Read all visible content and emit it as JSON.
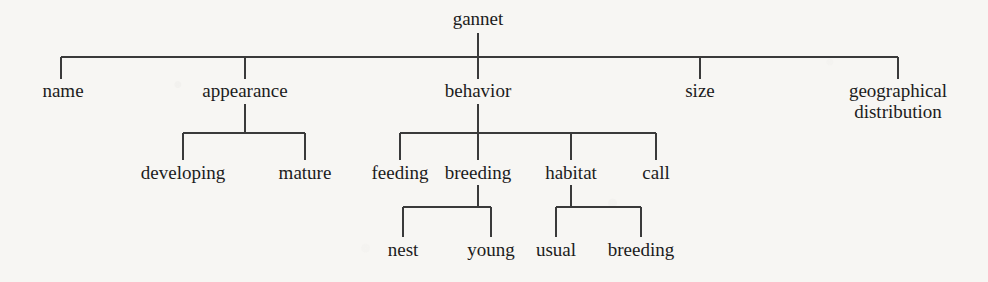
{
  "diagram": {
    "type": "tree",
    "title": "gannet",
    "line_color": "#3a3a3a",
    "text_color": "#1c1c1c",
    "background_color": "#f7f6f3",
    "root": {
      "label": "gannet",
      "x": 478,
      "y": 24
    },
    "level_one": [
      {
        "label": "name",
        "x": 63,
        "y": 96
      },
      {
        "label": "appearance",
        "x": 245,
        "y": 96
      },
      {
        "label": "behavior",
        "x": 478,
        "y": 96
      },
      {
        "label": "size",
        "x": 700,
        "y": 96
      },
      {
        "label": "geographical distribution",
        "x": 898,
        "y": 96,
        "wrap": true
      }
    ],
    "level_two": [
      {
        "label": "developing",
        "parent": "appearance",
        "x": 183,
        "y": 178
      },
      {
        "label": "mature",
        "parent": "appearance",
        "x": 305,
        "y": 178
      },
      {
        "label": "feeding",
        "parent": "behavior",
        "x": 400,
        "y": 178
      },
      {
        "label": "breeding",
        "parent": "behavior",
        "x": 478,
        "y": 178
      },
      {
        "label": "habitat",
        "parent": "behavior",
        "x": 571,
        "y": 178
      },
      {
        "label": "call",
        "parent": "behavior",
        "x": 656,
        "y": 178
      }
    ],
    "level_three": [
      {
        "label": "nest",
        "parent": "breeding",
        "x": 403,
        "y": 255
      },
      {
        "label": "young",
        "parent": "breeding",
        "x": 491,
        "y": 255
      },
      {
        "label": "usual",
        "parent": "habitat",
        "x": 556,
        "y": 255
      },
      {
        "label": "breeding",
        "parent": "habitat",
        "x": 641,
        "y": 255
      }
    ],
    "edges": {
      "root_stem": {
        "x": 478,
        "y1": 33,
        "y2": 57
      },
      "level_one_bar": {
        "y": 57,
        "x1": 61,
        "x2": 898
      },
      "level_one_drops": [
        {
          "x": 61,
          "y1": 57,
          "y2": 79
        },
        {
          "x": 245,
          "y1": 57,
          "y2": 79
        },
        {
          "x": 478,
          "y1": 57,
          "y2": 79
        },
        {
          "x": 700,
          "y1": 57,
          "y2": 79
        },
        {
          "x": 898,
          "y1": 57,
          "y2": 79
        }
      ],
      "appearance_stem": {
        "x": 245,
        "y1": 104,
        "y2": 133
      },
      "appearance_bar": {
        "y": 133,
        "x1": 183,
        "x2": 305
      },
      "appearance_drops": [
        {
          "x": 183,
          "y1": 133,
          "y2": 160
        },
        {
          "x": 305,
          "y1": 133,
          "y2": 160
        }
      ],
      "behavior_stem": {
        "x": 478,
        "y1": 104,
        "y2": 133
      },
      "behavior_bar": {
        "y": 133,
        "x1": 400,
        "x2": 656
      },
      "behavior_drops": [
        {
          "x": 400,
          "y1": 133,
          "y2": 160
        },
        {
          "x": 478,
          "y1": 133,
          "y2": 160
        },
        {
          "x": 571,
          "y1": 133,
          "y2": 160
        },
        {
          "x": 656,
          "y1": 133,
          "y2": 160
        }
      ],
      "breeding_stem": {
        "x": 478,
        "y1": 185,
        "y2": 207
      },
      "breeding_bar": {
        "y": 207,
        "x1": 403,
        "x2": 491
      },
      "breeding_drops": [
        {
          "x": 403,
          "y1": 207,
          "y2": 237
        },
        {
          "x": 491,
          "y1": 207,
          "y2": 237
        }
      ],
      "habitat_stem": {
        "x": 571,
        "y1": 185,
        "y2": 207
      },
      "habitat_bar": {
        "y": 207,
        "x1": 556,
        "x2": 641
      },
      "habitat_drops": [
        {
          "x": 556,
          "y1": 207,
          "y2": 237
        },
        {
          "x": 641,
          "y1": 207,
          "y2": 237
        }
      ]
    }
  }
}
